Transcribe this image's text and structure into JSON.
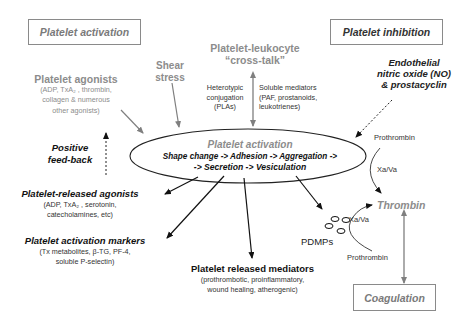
{
  "boxes": {
    "activation": "Platelet activation",
    "inhibition": "Platelet inhibition",
    "coagulation": "Coagulation"
  },
  "agonists": {
    "title": "Platelet agonists",
    "lines": [
      "(ADP, TxA₂ , thrombin,",
      "collagen & numerous",
      "other agonists)"
    ]
  },
  "shear": {
    "lines": [
      "Shear",
      "stress"
    ]
  },
  "crosstalk": {
    "title": "Platelet-leukocyte",
    "subtitle": "“cross-talk”",
    "left": [
      "Heterotypic",
      "conjugation",
      "(PLAs)"
    ],
    "right": [
      "Soluble mediators",
      "(PAF, prostanoids,",
      "leukotrienes)"
    ]
  },
  "endothelial": {
    "lines": [
      "Endothelial",
      "nitric oxide (NO)",
      "& prostacyclin"
    ]
  },
  "feedback": {
    "lines": [
      "Positive",
      "feed-back"
    ]
  },
  "ellipse": {
    "title": "Platelet activation",
    "line1": "Shape change -> Adhesion  -> Aggregation ->",
    "line2": "-> Secretion -> Vesiculation"
  },
  "released_agonists": {
    "title": "Platelet-released agonists",
    "lines": [
      "(ADP, TxA₂ , serotonin,",
      "catecholamines, etc)"
    ]
  },
  "markers": {
    "title": "Platelet activation markers",
    "lines": [
      "(Tx metabolites, β-TG, PF-4,",
      "soluble P-selectin)"
    ]
  },
  "mediators": {
    "title": "Platelet released mediators",
    "lines": [
      "(prothrombotic, proinflammatory,",
      "wound healing, atherogenic)"
    ]
  },
  "pdmps": "PDMPs",
  "coag_path": {
    "prothrombin_top": "Prothrombin",
    "xava_top": "Xa/Va",
    "thrombin": "Thrombin",
    "xava_bottom": "Xa/Va",
    "prothrombin_bottom": "Prothrombin"
  },
  "colors": {
    "grey": "#8c8c8c",
    "black": "#111111",
    "arrow_grey": "#7f7f7f"
  }
}
